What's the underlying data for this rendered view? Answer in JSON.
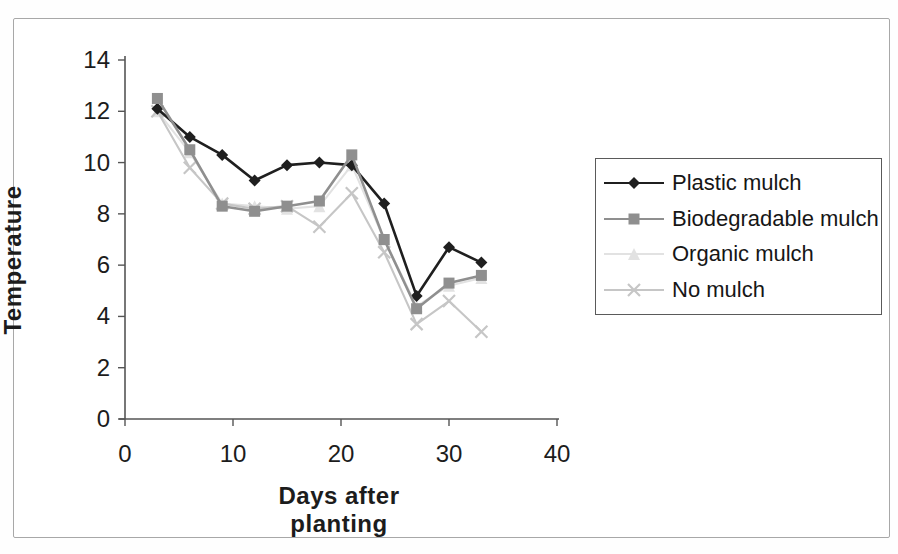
{
  "figure": {
    "background": "#ffffff",
    "border_color": "#a8a8a8"
  },
  "chart_data": {
    "type": "line",
    "title": "",
    "xlabel": "Days after planting",
    "ylabel": "Temperature",
    "xlim": [
      0,
      40
    ],
    "ylim": [
      0,
      14
    ],
    "x_ticks": [
      0,
      10,
      20,
      30,
      40
    ],
    "y_ticks": [
      0,
      2,
      4,
      6,
      8,
      10,
      12,
      14
    ],
    "grid": false,
    "legend_position": "right",
    "x": [
      3,
      6,
      9,
      12,
      15,
      18,
      21,
      24,
      27,
      30,
      33
    ],
    "series": [
      {
        "name": "Plastic mulch",
        "marker": "diamond",
        "color": "#1f1f1f",
        "values": [
          12.1,
          11.0,
          10.3,
          9.3,
          9.9,
          10.0,
          9.9,
          8.4,
          4.8,
          6.7,
          6.1
        ]
      },
      {
        "name": "Biodegradable mulch",
        "marker": "square",
        "color": "#8f8f8f",
        "values": [
          12.5,
          10.5,
          8.3,
          8.1,
          8.3,
          8.5,
          10.3,
          7.0,
          4.3,
          5.3,
          5.6
        ]
      },
      {
        "name": "Organic mulch",
        "marker": "triangle",
        "color": "#e2e2e2",
        "values": [
          12.0,
          10.4,
          8.4,
          8.3,
          8.2,
          8.3,
          9.9,
          7.0,
          4.4,
          5.2,
          5.5
        ]
      },
      {
        "name": "No mulch",
        "marker": "x",
        "color": "#c6c6c6",
        "values": [
          12.0,
          9.8,
          8.4,
          8.2,
          8.3,
          7.5,
          8.8,
          6.5,
          3.7,
          4.6,
          3.4
        ]
      }
    ],
    "axis_color": "#555555",
    "tick_label_color": "#1c1c1c"
  }
}
